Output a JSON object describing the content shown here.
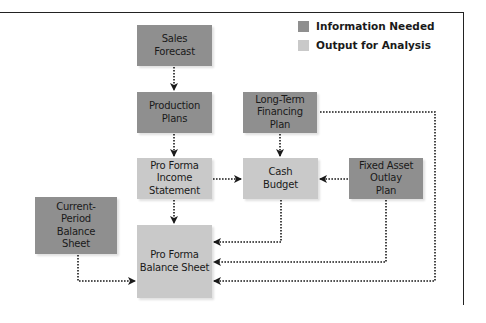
{
  "legend": [
    {
      "label": "Information Needed",
      "color": "#8f8f8f"
    },
    {
      "label": "Output for Analysis",
      "color": "#c9c9c9"
    }
  ],
  "nodes": {
    "sales_forecast": "Sales\nForecast",
    "production_plans": "Production\nPlans",
    "long_term_financing_plan": "Long-Term\nFinancing\nPlan",
    "pro_forma_income_statement": "Pro Forma\nIncome\nStatement",
    "cash_budget": "Cash\nBudget",
    "fixed_asset_outlay_plan": "Fixed Asset\nOutlay\nPlan",
    "current_period_balance_sheet": "Current-\nPeriod\nBalance\nSheet",
    "pro_forma_balance_sheet": "Pro Forma\nBalance Sheet"
  },
  "edges": [
    {
      "from": "Sales Forecast",
      "to": "Production Plans"
    },
    {
      "from": "Production Plans",
      "to": "Pro Forma Income Statement"
    },
    {
      "from": "Long-Term Financing Plan",
      "to": "Cash Budget"
    },
    {
      "from": "Pro Forma Income Statement",
      "to": "Cash Budget"
    },
    {
      "from": "Fixed Asset Outlay Plan",
      "to": "Cash Budget"
    },
    {
      "from": "Pro Forma Income Statement",
      "to": "Pro Forma Balance Sheet"
    },
    {
      "from": "Current-Period Balance Sheet",
      "to": "Pro Forma Balance Sheet"
    },
    {
      "from": "Cash Budget",
      "to": "Pro Forma Balance Sheet"
    },
    {
      "from": "Fixed Asset Outlay Plan",
      "to": "Pro Forma Balance Sheet"
    },
    {
      "from": "Long-Term Financing Plan",
      "to": "Pro Forma Balance Sheet"
    }
  ],
  "colors": {
    "information_needed": "#8f8f8f",
    "output_for_analysis": "#c9c9c9",
    "line": "#1a1a1a"
  }
}
